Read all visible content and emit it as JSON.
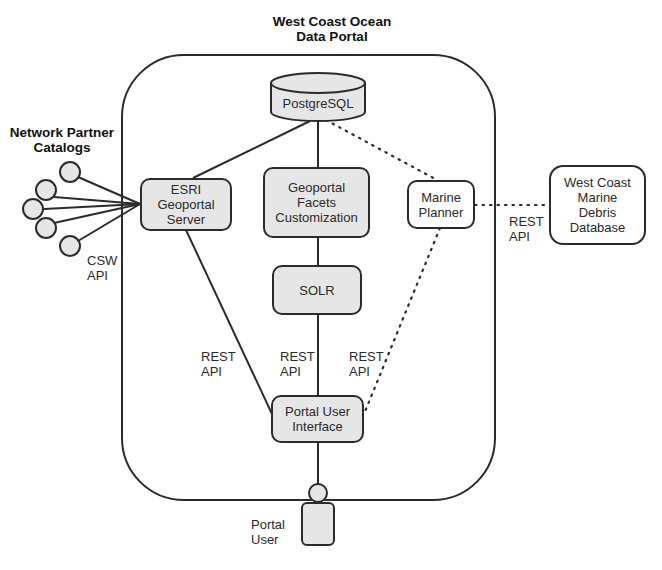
{
  "title": {
    "portal": "West Coast Ocean\nData Portal",
    "partners": "Network Partner\nCatalogs"
  },
  "nodes": {
    "postgresql": "PostgreSQL",
    "esri": "ESRI\nGeoportal\nServer",
    "facets": "Geoportal\nFacets\nCustomization",
    "marine_planner": "Marine\nPlanner",
    "solr": "SOLR",
    "portal_ui": "Portal User\nInterface",
    "debris_db": "West Coast\nMarine\nDebris\nDatabase",
    "portal_user": "Portal\nUser"
  },
  "edge_labels": {
    "csw": "CSW\nAPI",
    "rest_esri": "REST\nAPI",
    "rest_solr": "REST\nAPI",
    "rest_marine": "REST\nAPI",
    "rest_debris": "REST\nAPI"
  },
  "colors": {
    "stroke": "#2b2b2b",
    "fill_gray": "#e6e6e6",
    "fill_white": "#ffffff"
  }
}
